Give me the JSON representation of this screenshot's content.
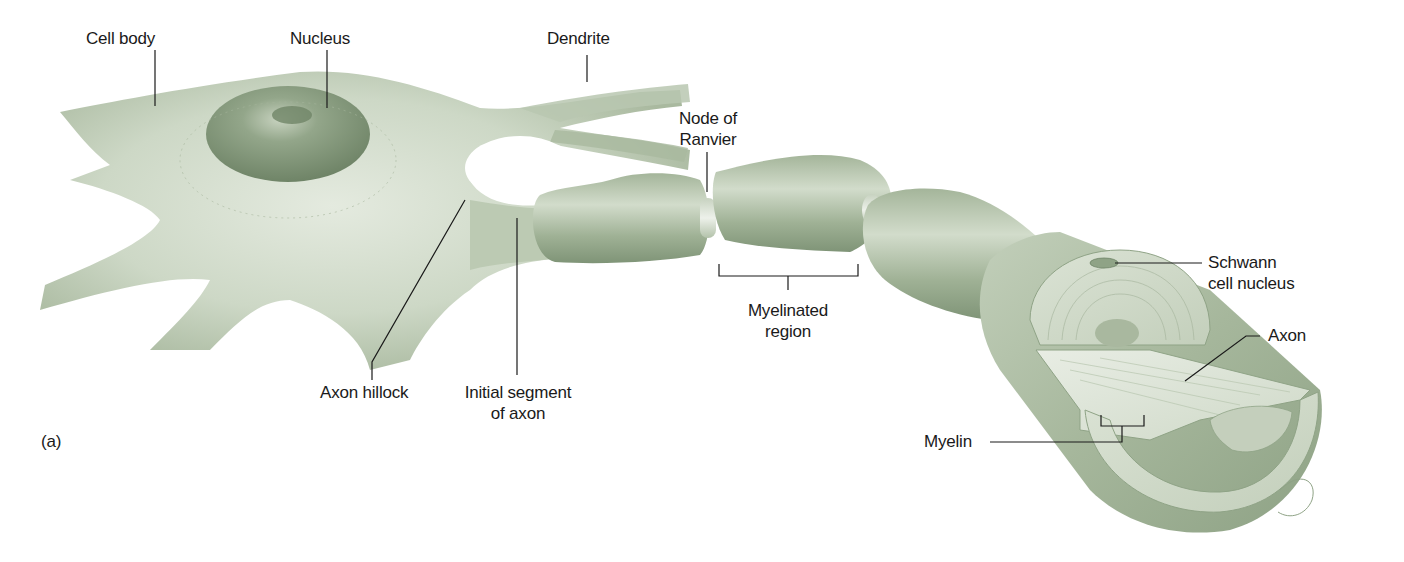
{
  "figure": {
    "panel_label": "(a)",
    "colors": {
      "background": "#ffffff",
      "cell_light": "#d9e2d3",
      "cell_mid": "#b7c6ad",
      "cell_dark": "#8fa386",
      "nucleus": "#7f9477",
      "leader_line": "#1a1a1a",
      "label_text": "#1a1a1a"
    },
    "labels": {
      "cell_body": "Cell body",
      "nucleus": "Nucleus",
      "dendrite": "Dendrite",
      "node_of_ranvier": "Node of\nRanvier",
      "axon_hillock": "Axon hillock",
      "initial_segment": "Initial segment\nof axon",
      "myelinated_region": "Myelinated\nregion",
      "schwann_cell_nucleus": "Schwann\ncell nucleus",
      "axon": "Axon",
      "myelin": "Myelin"
    }
  }
}
